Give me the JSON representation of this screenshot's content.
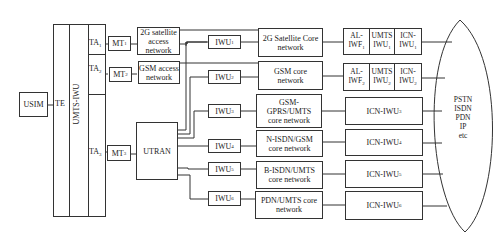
{
  "diagram": {
    "usim": "USIM",
    "te": "TE",
    "umts_iwu": "UMTS-IWU",
    "ta": [
      {
        "name": "TA",
        "sub": "1"
      },
      {
        "name": "TA",
        "sub": "2"
      },
      {
        "name": "TA",
        "sub": "3"
      }
    ],
    "mt": [
      {
        "name": "MT",
        "sub": "1"
      },
      {
        "name": "MT",
        "sub": "2"
      },
      {
        "name": "MT",
        "sub": "3"
      }
    ],
    "access_networks": [
      {
        "line1": "2G satellite",
        "line2": "access",
        "line3": "network"
      },
      {
        "line1": "GSM access",
        "line2": "network"
      }
    ],
    "utran": "UTRAN",
    "iwu": [
      {
        "name": "IWU",
        "sub": "1"
      },
      {
        "name": "IWU",
        "sub": "2"
      },
      {
        "name": "IWU",
        "sub": "3"
      },
      {
        "name": "IWU",
        "sub": "4"
      },
      {
        "name": "IWU",
        "sub": "5"
      },
      {
        "name": "IWU",
        "sub": "6"
      }
    ],
    "core_networks": [
      {
        "line1": "2G Satellite Core",
        "line2": "network"
      },
      {
        "line1": "GSM core",
        "line2": "network"
      },
      {
        "line1": "GSM-",
        "line2": "GPRS/UMTS",
        "line3": "core network"
      },
      {
        "line1": "N-ISDN/GSM",
        "line2": "core network"
      },
      {
        "line1": "B-ISDN/UMTS",
        "line2": "core network"
      },
      {
        "line1": "PDN/UMTS core",
        "line2": "network"
      }
    ],
    "interworking_split": [
      {
        "al": "AL-",
        "iwf": "IWF",
        "iwf_sub": "1",
        "umts": "UMTS",
        "umts_iwu": "IWU",
        "umts_sub": "1",
        "icn": "ICN-",
        "icn_iwu": "IWU",
        "icn_sub": "1"
      },
      {
        "al": "AL-",
        "iwf": "IWF",
        "iwf_sub": "2",
        "umts": "UMTS",
        "umts_iwu": "IWU",
        "umts_sub": "2",
        "icn": "ICN-",
        "icn_iwu": "IWU",
        "icn_sub": "2"
      }
    ],
    "icn_iwu": [
      {
        "name": "ICN-IWU",
        "sub": "3"
      },
      {
        "name": "ICN-IWU",
        "sub": "4"
      },
      {
        "name": "ICN-IWU",
        "sub": "5"
      },
      {
        "name": "ICN-IWU",
        "sub": "6"
      }
    ],
    "external_networks": [
      "PSTN",
      "ISDN",
      "PDN",
      "IP",
      "etc"
    ]
  }
}
